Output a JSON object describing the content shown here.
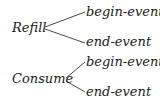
{
  "diagram": {
    "type": "tree",
    "nodes": [
      {
        "label": "Refill",
        "children": [
          "begin-event",
          "end-event"
        ]
      },
      {
        "label": "Consume",
        "children": [
          "begin-event",
          "end-event"
        ]
      }
    ],
    "refill": {
      "label": "Refill",
      "begin": "begin-event",
      "end": "end-event"
    },
    "consume": {
      "label": "Consume",
      "begin": "begin-event",
      "end": "end-event"
    },
    "colors": {
      "text": "#1a1a1a",
      "line": "#333333",
      "background": "#ffffff"
    }
  }
}
